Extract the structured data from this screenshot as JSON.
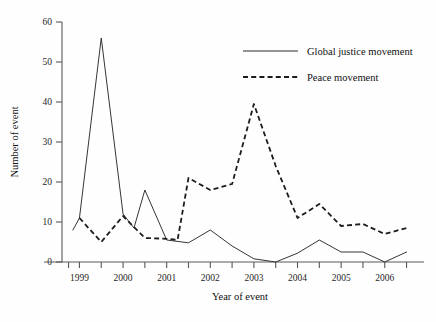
{
  "chart_data": {
    "type": "line",
    "title": "",
    "xlabel": "Year of event",
    "ylabel": "Number of event",
    "xlim": [
      1998.6,
      2006.9
    ],
    "ylim": [
      0,
      60
    ],
    "yticks": [
      0,
      10,
      20,
      30,
      40,
      50,
      60
    ],
    "ytick_labels": [
      "0",
      "10",
      "20",
      "30",
      "40",
      "50",
      "60"
    ],
    "xticks": [
      1999,
      2000,
      2001,
      2002,
      2003,
      2004,
      2005,
      2006
    ],
    "xtick_labels": [
      "1999",
      "2000",
      "2001",
      "2002",
      "2003",
      "2004",
      "2005",
      "2006"
    ],
    "minor_xticks": [
      1998.75,
      1999.5,
      2000.5,
      2001.5,
      2002.5,
      2003.5,
      2004.5,
      2005.5,
      2006.5
    ],
    "grid": false,
    "legend_position": "top-right",
    "x": [
      1998.85,
      1999.0,
      1999.5,
      2000.0,
      2000.25,
      2000.5,
      2001.0,
      2001.5,
      2002.0,
      2002.5,
      2003.0,
      2003.5,
      2004.0,
      2004.5,
      2005.0,
      2005.5,
      2006.0,
      2006.5
    ],
    "series": [
      {
        "name": "Global justice movement",
        "style": "solid",
        "color": "#2a2a2a",
        "x": [
          1998.85,
          1999.0,
          1999.5,
          2000.0,
          2000.25,
          2000.5,
          2001.0,
          2001.5,
          2002.0,
          2002.5,
          2003.0,
          2003.5,
          2004.0,
          2004.5,
          2005.0,
          2005.5,
          2006.0,
          2006.5
        ],
        "values": [
          8.0,
          11.0,
          56.0,
          12.0,
          8.5,
          18.0,
          5.5,
          4.8,
          8.0,
          4.0,
          0.8,
          0.0,
          2.2,
          5.5,
          2.5,
          2.5,
          0.0,
          2.5
        ]
      },
      {
        "name": "Peace movement",
        "style": "dashed",
        "color": "#1c1c1c",
        "x": [
          1999.0,
          1999.5,
          2000.0,
          2000.5,
          2001.0,
          2001.25,
          2001.5,
          2002.0,
          2002.5,
          2003.0,
          2003.5,
          2004.0,
          2004.5,
          2005.0,
          2005.5,
          2006.0,
          2006.5
        ],
        "values": [
          11.0,
          5.0,
          11.5,
          6.0,
          5.8,
          5.5,
          21.0,
          18.0,
          19.5,
          39.5,
          24.0,
          11.0,
          14.5,
          9.0,
          9.5,
          7.0,
          8.5
        ]
      }
    ],
    "legend": [
      {
        "label": "Global justice movement",
        "style": "solid"
      },
      {
        "label": "Peace movement",
        "style": "dashed"
      }
    ]
  }
}
